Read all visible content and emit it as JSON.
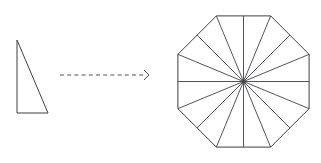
{
  "figure": {
    "caption": "",
    "background_color": "#ffffff",
    "stroke_color": "#3f3f46",
    "arrow_color": "#53535a",
    "left_shape": {
      "name": "right-triangle",
      "label": "",
      "vertices": [
        [
          17,
          40
        ],
        [
          17,
          113
        ],
        [
          48,
          113
        ]
      ],
      "description": "right triangle, vertical leg on the left, horizontal leg on the bottom"
    },
    "arrow": {
      "name": "transformation-arrow",
      "label": "",
      "style": "dashed",
      "direction": "right",
      "start": [
        60,
        75
      ],
      "end": [
        149,
        75
      ],
      "head_size": 5
    },
    "right_shape": {
      "name": "regular-octagon-16-triangles",
      "label": "",
      "sides": 8,
      "triangle_count": 16,
      "center": [
        243.5,
        81.5
      ],
      "circumradius": 71,
      "rotation_degrees": 22.5,
      "description": "regular octagon partitioned into 16 congruent triangles by rays from the center to every vertex and every edge midpoint"
    }
  }
}
